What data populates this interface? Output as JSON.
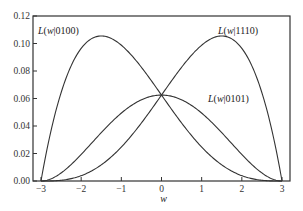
{
  "chart_data": {
    "type": "line",
    "title": "",
    "xlabel": "w",
    "ylabel": "",
    "xlim": [
      -3.2,
      3.2
    ],
    "ylim": [
      0,
      0.12
    ],
    "xticks": [
      -3,
      -2,
      -1,
      0,
      1,
      2,
      3
    ],
    "xtick_labels": [
      "−3",
      "−2",
      "−1",
      "0",
      "1",
      "2",
      "3"
    ],
    "yticks": [
      0,
      0.02,
      0.04,
      0.06,
      0.08,
      0.1,
      0.12
    ],
    "ytick_labels": [
      "0.00",
      "0.02",
      "0.04",
      "0.06",
      "0.08",
      "0.10",
      "0.12"
    ],
    "grid": false,
    "legend": "inline annotations",
    "series": [
      {
        "name": "L(w|0100)",
        "label_pos": [
          -2.6,
          0.107
        ],
        "peak": {
          "w": -1.5,
          "L": 0.1055
        }
      },
      {
        "name": "L(w|1110)",
        "label_pos": [
          2.0,
          0.107
        ],
        "peak": {
          "w": 1.5,
          "L": 0.1055
        }
      },
      {
        "name": "L(w|0101)",
        "label_pos": [
          0.7,
          0.061
        ],
        "peak": {
          "w": 0,
          "L": 0.0625
        }
      }
    ],
    "x": [
      -3,
      -2.5,
      -2,
      -1.5,
      -1,
      -0.5,
      0,
      0.5,
      1,
      1.5,
      2,
      2.5,
      3
    ]
  },
  "labels": {
    "s0": "L(w|0100)",
    "s1": "L(w|1110)",
    "s2": "L(w|0101)",
    "xlabel": "w"
  }
}
